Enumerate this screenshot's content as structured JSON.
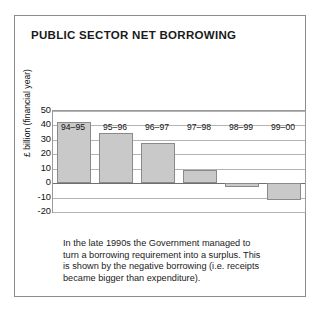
{
  "figure": {
    "title": "PUBLIC SECTOR NET BORROWING",
    "caption_lines": [
      "In the late 1990s the Government managed to",
      "turn a borrowing requirement into a surplus. This",
      "is shown by the negative borrowing (i.e. receipts",
      "became bigger than expenditure)."
    ],
    "frame_color": "#8c8c8c",
    "bar_fill_color": "#c9c9c9",
    "bar_edge_color": "#8a8a8a",
    "grid_color": "#b4b4b4"
  },
  "chart_data": {
    "type": "bar",
    "title": "PUBLIC SECTOR NET BORROWING",
    "xlabel": "",
    "ylabel": "£ billion (financial year)",
    "categories": [
      "94–95",
      "95–96",
      "96–97",
      "97–98",
      "98–99",
      "99–00"
    ],
    "values": [
      42.5,
      35,
      27.5,
      9,
      -3,
      -12
    ],
    "ylim": [
      -20,
      50
    ],
    "yticks": [
      50,
      40,
      30,
      20,
      10,
      0,
      -10,
      -20
    ],
    "ytick_labels": [
      "50",
      "40",
      "30",
      "20",
      "10",
      "0",
      "-10",
      "-20"
    ],
    "grid": true,
    "grid_axis": "y",
    "legend": false,
    "legend_position": "none",
    "annotations": [
      "In the late 1990s the Government managed to turn a borrowing requirement into a surplus. This is shown by the negative borrowing (i.e. receipts became bigger than expenditure)."
    ]
  }
}
